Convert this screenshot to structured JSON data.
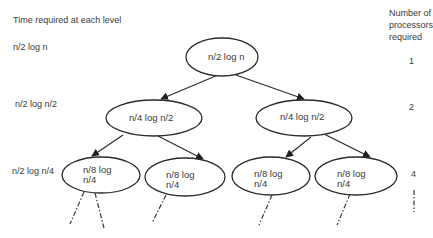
{
  "left_header": "Time required at each level",
  "right_header": [
    "Number of",
    "processors",
    "required"
  ],
  "level_times": [
    "n/2 log n",
    "n/2 log n/2",
    "n/2 log n/4"
  ],
  "processor_counts": [
    "1",
    "2",
    "4"
  ],
  "nodes": {
    "root": {
      "line1": "n/2 log  n"
    },
    "l2_left": {
      "line1": "n/4 log  n/2"
    },
    "l2_right": {
      "line1": "n/4 log  n/2"
    },
    "l3_1": {
      "line1": "n/8 log",
      "line2": "n/4"
    },
    "l3_2": {
      "line1": "n/8 log",
      "line2": "n/4"
    },
    "l3_3": {
      "line1": "n/8 log",
      "line2": "n/4"
    },
    "l3_4": {
      "line1": "n/8 log",
      "line2": "n/4"
    }
  },
  "colors": {
    "stroke": "#2a2a2a",
    "text": "#3a3a3a",
    "background": "#ffffff"
  }
}
